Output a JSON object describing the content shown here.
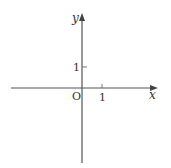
{
  "diagram": {
    "type": "coordinate-plane",
    "axes": {
      "x_label": "x",
      "y_label": "y",
      "origin_label": "O"
    },
    "ticks": {
      "x_tick_label": "1",
      "y_tick_label": "1"
    },
    "colors": {
      "axis": "#555555",
      "text": "#333333"
    }
  }
}
